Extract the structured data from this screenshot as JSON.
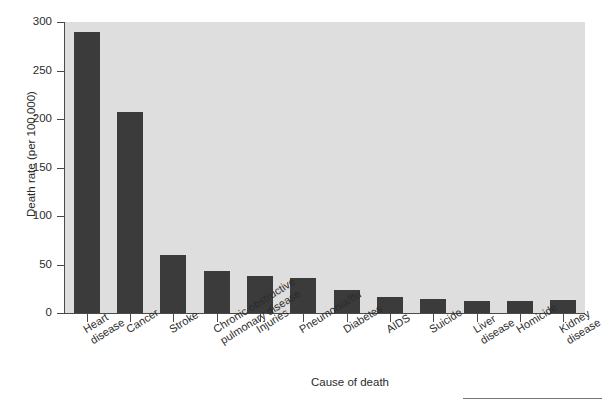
{
  "chart_data": {
    "type": "bar",
    "title": "",
    "xlabel": "Cause of death",
    "ylabel": "Death rate (per 100,000)",
    "categories": [
      "Heart\ndisease",
      "Cancer",
      "Stroke",
      "Chronic obstructive\npulmonary disease",
      "Injuries",
      "Pneumonia/flu",
      "Diabetes",
      "AIDS",
      "Suicide",
      "Liver\ndisease",
      "Homicide",
      "Kidney\ndisease"
    ],
    "values": [
      290,
      207,
      60,
      43,
      38,
      36,
      24,
      17,
      14,
      12,
      12,
      13
    ],
    "ylim": [
      0,
      300
    ],
    "yticks": [
      0,
      50,
      100,
      150,
      200,
      250,
      300
    ],
    "ytick_labels": [
      "0",
      "50",
      "100",
      "150",
      "200",
      "250",
      "300"
    ],
    "grid": false,
    "legend": null,
    "bar_color": "#3b3b3b",
    "panel_color": "#dedede",
    "axis_color": "#4a4a4a"
  }
}
